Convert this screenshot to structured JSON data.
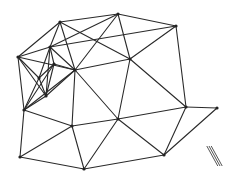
{
  "diagram": {
    "type": "triangulated-mesh",
    "colors": {
      "edge": "#2a2a2a",
      "node": "#222222",
      "background": "#ffffff",
      "mark": "#555555"
    },
    "nodes": [
      {
        "id": "A",
        "x": 60,
        "y": 22
      },
      {
        "id": "B",
        "x": 118,
        "y": 14
      },
      {
        "id": "C",
        "x": 176,
        "y": 26
      },
      {
        "id": "D",
        "x": 18,
        "y": 57
      },
      {
        "id": "E",
        "x": 50,
        "y": 47
      },
      {
        "id": "F",
        "x": 75,
        "y": 70
      },
      {
        "id": "G",
        "x": 130,
        "y": 59
      },
      {
        "id": "H",
        "x": 186,
        "y": 107
      },
      {
        "id": "I",
        "x": 24,
        "y": 110
      },
      {
        "id": "J",
        "x": 39,
        "y": 78
      },
      {
        "id": "K",
        "x": 54,
        "y": 64
      },
      {
        "id": "L",
        "x": 46,
        "y": 96
      },
      {
        "id": "M",
        "x": 72,
        "y": 126
      },
      {
        "id": "N",
        "x": 118,
        "y": 119
      },
      {
        "id": "O",
        "x": 20,
        "y": 157
      },
      {
        "id": "P",
        "x": 84,
        "y": 169
      },
      {
        "id": "Q",
        "x": 164,
        "y": 155
      },
      {
        "id": "R",
        "x": 217,
        "y": 108
      }
    ],
    "edges": [
      [
        "A",
        "B"
      ],
      [
        "B",
        "C"
      ],
      [
        "A",
        "D"
      ],
      [
        "A",
        "E"
      ],
      [
        "A",
        "F"
      ],
      [
        "A",
        "G"
      ],
      [
        "B",
        "E"
      ],
      [
        "B",
        "F"
      ],
      [
        "B",
        "G"
      ],
      [
        "C",
        "G"
      ],
      [
        "C",
        "E"
      ],
      [
        "C",
        "H"
      ],
      [
        "G",
        "H"
      ],
      [
        "G",
        "F"
      ],
      [
        "G",
        "N"
      ],
      [
        "D",
        "E"
      ],
      [
        "D",
        "F"
      ],
      [
        "D",
        "I"
      ],
      [
        "D",
        "J"
      ],
      [
        "D",
        "L"
      ],
      [
        "E",
        "F"
      ],
      [
        "E",
        "K"
      ],
      [
        "E",
        "J"
      ],
      [
        "F",
        "K"
      ],
      [
        "F",
        "L"
      ],
      [
        "F",
        "M"
      ],
      [
        "F",
        "N"
      ],
      [
        "F",
        "I"
      ],
      [
        "J",
        "K"
      ],
      [
        "J",
        "L"
      ],
      [
        "J",
        "I"
      ],
      [
        "K",
        "L"
      ],
      [
        "K",
        "I"
      ],
      [
        "L",
        "I"
      ],
      [
        "I",
        "M"
      ],
      [
        "I",
        "O"
      ],
      [
        "M",
        "N"
      ],
      [
        "M",
        "O"
      ],
      [
        "M",
        "P"
      ],
      [
        "N",
        "H"
      ],
      [
        "N",
        "Q"
      ],
      [
        "N",
        "P"
      ],
      [
        "H",
        "R"
      ],
      [
        "H",
        "Q"
      ],
      [
        "R",
        "Q"
      ],
      [
        "O",
        "P"
      ],
      [
        "P",
        "Q"
      ],
      [
        "E",
        "L"
      ]
    ],
    "annotation": {
      "type": "parallel-lines",
      "count": 3,
      "x1": 209,
      "y1": 146,
      "x2": 220,
      "y2": 166
    }
  }
}
